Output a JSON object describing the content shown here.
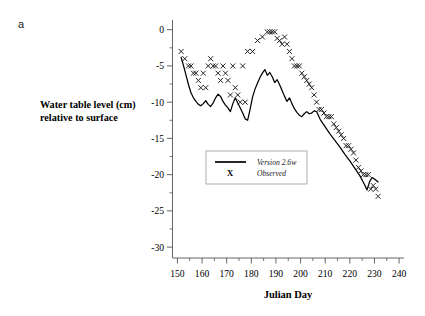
{
  "panel": {
    "label": "a"
  },
  "top_caption": {
    "text": ""
  },
  "colors": {
    "line": "#000000",
    "marker": "#1a1a1a",
    "axis": "#555555",
    "legend_border": "#9a9a9a",
    "background": "#ffffff"
  },
  "legend": {
    "position": "inside-center-left",
    "entries": [
      {
        "label": "Version 2.6w",
        "kind": "line"
      },
      {
        "label": "Observed",
        "kind": "marker",
        "glyph": "X"
      }
    ]
  },
  "chart_data": {
    "type": "line",
    "title": "",
    "xlabel": "Julian Day",
    "ylabel": "Water table level (cm) relative to surface",
    "xlim": [
      148,
      242
    ],
    "ylim": [
      -31.5,
      1.2
    ],
    "grid": false,
    "xticks": [
      150,
      160,
      170,
      180,
      190,
      200,
      210,
      220,
      230,
      240
    ],
    "xtick_labels": [
      "150",
      "160",
      "170",
      "180",
      "190",
      "200",
      "210",
      "220",
      "230",
      "240"
    ],
    "x_minor_step": 5,
    "yticks": [
      0,
      -5,
      -10,
      -15,
      -20,
      -25,
      -30
    ],
    "ytick_labels": [
      "0",
      "-5",
      "-10",
      "-15",
      "-20",
      "-25",
      "-30"
    ],
    "y_minor_step": 2.5,
    "series": [
      {
        "name": "Version 2.6w",
        "kind": "line",
        "x": [
          151.5,
          152.5,
          153.5,
          154.5,
          155.5,
          156.5,
          157.5,
          158.5,
          159.5,
          160.5,
          161.5,
          162.5,
          163.5,
          164.5,
          165.5,
          166.5,
          167.5,
          168.5,
          169.5,
          170.5,
          171.5,
          172.5,
          173.5,
          174.5,
          175.5,
          176.5,
          177.5,
          178.5,
          179.5,
          180.5,
          181.5,
          182.5,
          183.5,
          184.5,
          185.5,
          186.5,
          187.5,
          188.5,
          189.5,
          190.5,
          191.5,
          192.5,
          193.5,
          194.5,
          195.5,
          196.5,
          197.5,
          198.5,
          199.5,
          200.5,
          201.5,
          202.5,
          203.5,
          204.5,
          205.5,
          206.5,
          208,
          210,
          212,
          214,
          216,
          218,
          220,
          222,
          224,
          226,
          227,
          228,
          229,
          230,
          231.5
        ],
        "y": [
          -3.8,
          -5.0,
          -6.3,
          -7.6,
          -8.7,
          -9.4,
          -9.9,
          -10.3,
          -10.5,
          -10.2,
          -9.8,
          -10.3,
          -10.6,
          -10.1,
          -9.4,
          -8.9,
          -9.2,
          -9.9,
          -10.4,
          -10.8,
          -11.3,
          -10.2,
          -9.4,
          -10.1,
          -10.8,
          -11.5,
          -12.3,
          -12.5,
          -11.0,
          -9.3,
          -8.2,
          -7.4,
          -6.6,
          -6.0,
          -5.5,
          -6.3,
          -5.9,
          -6.5,
          -7.3,
          -6.9,
          -7.6,
          -8.4,
          -9.2,
          -9.9,
          -9.4,
          -10.2,
          -10.9,
          -11.4,
          -11.8,
          -12.0,
          -11.6,
          -11.3,
          -11.6,
          -11.5,
          -11.2,
          -11.3,
          -12.4,
          -13.4,
          -14.4,
          -15.3,
          -16.2,
          -17.2,
          -18.1,
          -19.1,
          -20.1,
          -21.4,
          -22.1,
          -21.0,
          -20.4,
          -20.6,
          -21.0
        ]
      },
      {
        "name": "Observed",
        "kind": "scatter",
        "marker": "x",
        "x": [
          151.5,
          153,
          154.5,
          155.5,
          156.5,
          157.5,
          158.5,
          159.5,
          160.5,
          161.5,
          162.5,
          163.5,
          164.5,
          165.5,
          166.5,
          167.5,
          168.5,
          169.5,
          170.5,
          171.5,
          172.5,
          173.5,
          174.5,
          175.5,
          176.5,
          177.5,
          178.5,
          180.5,
          182.5,
          184.5,
          186.5,
          187.5,
          188.5,
          189.5,
          190.5,
          191.5,
          192.5,
          193.5,
          194.5,
          195.5,
          196.5,
          197.5,
          198.5,
          199.5,
          200.5,
          201.5,
          202.5,
          203.5,
          204.5,
          205.5,
          206.5,
          207.5,
          208.5,
          209.5,
          210.5,
          211.5,
          212.5,
          213.5,
          214.5,
          215.5,
          216.5,
          217.5,
          218.5,
          219.5,
          220.5,
          221.5,
          222.5,
          223.5,
          224.5,
          225.5,
          226.5,
          227.5,
          228.5,
          229.5,
          230.5,
          231.5
        ],
        "y": [
          -3.0,
          -4.0,
          -5.0,
          -5.0,
          -6.0,
          -6.0,
          -7.0,
          -8.0,
          -6.0,
          -8.0,
          -5.0,
          -4.0,
          -5.0,
          -5.0,
          -6.0,
          -7.0,
          -5.0,
          -6.0,
          -7.0,
          -9.0,
          -5.0,
          -8.0,
          -9.0,
          -10.0,
          -5.0,
          -10.0,
          -3.0,
          -3.0,
          -1.5,
          -1.0,
          -0.3,
          -0.3,
          -0.3,
          -0.3,
          -1.2,
          -1.5,
          -2.0,
          -1.0,
          -2.0,
          -3.0,
          -4.0,
          -5.0,
          -5.0,
          -5.0,
          -6.0,
          -6.5,
          -7.0,
          -7.5,
          -8.0,
          -9.0,
          -10.0,
          -11.0,
          -11.0,
          -11.5,
          -12.0,
          -12.0,
          -12.0,
          -13.0,
          -13.5,
          -14.0,
          -14.5,
          -15.0,
          -16.0,
          -16.0,
          -16.5,
          -17.0,
          -18.0,
          -19.0,
          -19.5,
          -20.0,
          -20.0,
          -20.0,
          -22.0,
          -21.5,
          -22.0,
          -23.0
        ]
      }
    ]
  }
}
